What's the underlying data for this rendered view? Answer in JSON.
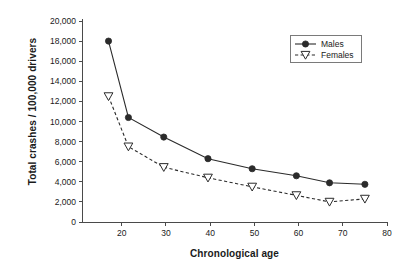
{
  "chart_data": {
    "type": "line",
    "title": "",
    "xlabel": "Chronological age",
    "ylabel": "Total crashes / 100,000 drivers",
    "xlim": [
      11,
      80
    ],
    "ylim": [
      0,
      20000
    ],
    "xticks": [
      "20",
      "30",
      "40",
      "50",
      "60",
      "70",
      "80"
    ],
    "xtick_values": [
      20,
      30,
      40,
      50,
      60,
      70,
      80
    ],
    "yticks": [
      "0",
      "2,000",
      "4,000",
      "6,000",
      "8,000",
      "10,000",
      "12,000",
      "14,000",
      "16,000",
      "18,000",
      "20,000"
    ],
    "ytick_values": [
      0,
      2000,
      4000,
      6000,
      8000,
      10000,
      12000,
      14000,
      16000,
      18000,
      20000
    ],
    "grid": false,
    "legend_position": "upper right",
    "series": [
      {
        "name": "Males",
        "marker": "filled-circle",
        "linestyle": "solid",
        "color": "#2b2b2b",
        "x": [
          17,
          21.5,
          29.5,
          39.5,
          49.5,
          59.5,
          67,
          75
        ],
        "values": [
          18000,
          10400,
          8450,
          6300,
          5300,
          4600,
          3900,
          3750
        ]
      },
      {
        "name": "Females",
        "marker": "open-triangle-down",
        "linestyle": "dashed",
        "color": "#2b2b2b",
        "x": [
          17,
          21.5,
          29.5,
          39.5,
          49.5,
          59.5,
          67,
          75
        ],
        "values": [
          12500,
          7500,
          5450,
          4400,
          3500,
          2650,
          2000,
          2300
        ]
      }
    ]
  },
  "legend": {
    "items": [
      {
        "label": "Males"
      },
      {
        "label": "Females"
      }
    ]
  },
  "axes": {
    "x_title": "Chronological age",
    "y_title": "Total crashes / 100,000 drivers"
  }
}
